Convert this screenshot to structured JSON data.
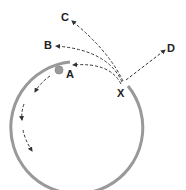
{
  "diagram": {
    "type": "trajectory-diagram",
    "labels": {
      "A": "A",
      "B": "B",
      "C": "C",
      "D": "D",
      "X": "X"
    },
    "colors": {
      "track": "#999999",
      "ball": "#9a9a9a",
      "dashed": "#333333",
      "text": "#222222"
    },
    "elements": [
      {
        "id": "circular-track",
        "desc": "open circular arc track, gap at top-right between start near A and point X"
      },
      {
        "id": "ball",
        "desc": "gray ball near label A inside track"
      },
      {
        "id": "path-A",
        "desc": "dashed arrow from X curving back toward A"
      },
      {
        "id": "path-B",
        "desc": "dashed arrow from X curving toward B"
      },
      {
        "id": "path-C",
        "desc": "dashed arrow from X toward C"
      },
      {
        "id": "path-D",
        "desc": "dashed straight arrow from X toward D"
      },
      {
        "id": "inner-path",
        "desc": "dashed arrows inside left side of track going down"
      }
    ]
  }
}
